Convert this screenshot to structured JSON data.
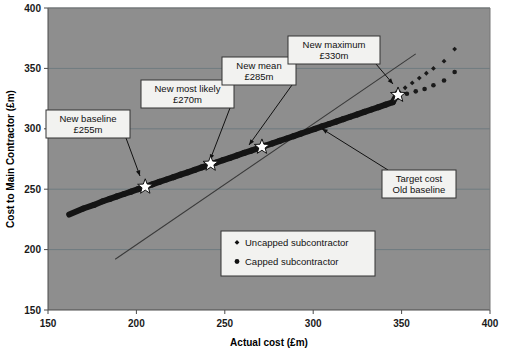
{
  "chart_data": {
    "type": "scatter",
    "title": "",
    "xlabel": "Actual cost (£m)",
    "ylabel": "Cost to Main Contractor (£m)",
    "xlim": [
      150,
      400
    ],
    "ylim": [
      150,
      400
    ],
    "xticks": [
      "150",
      "200",
      "250",
      "300",
      "350",
      "400"
    ],
    "yticks": [
      "150",
      "200",
      "250",
      "300",
      "350",
      "400"
    ],
    "grid": true,
    "legend_position": "inside-lower-center",
    "plot_background": "#8e8e8e",
    "series": [
      {
        "name": "Uncapped subcontractor",
        "marker": "diamond",
        "color": "#1a1a1a",
        "points": [
          [
            162,
            229
          ],
          [
            170,
            234
          ],
          [
            176,
            237
          ],
          [
            181,
            240
          ],
          [
            185,
            242
          ],
          [
            189,
            244
          ],
          [
            193,
            246
          ],
          [
            197,
            248
          ],
          [
            201,
            250
          ],
          [
            205,
            252
          ],
          [
            209,
            254
          ],
          [
            213,
            256
          ],
          [
            217,
            258
          ],
          [
            221,
            260
          ],
          [
            225,
            262
          ],
          [
            229,
            264
          ],
          [
            233,
            266
          ],
          [
            237,
            268
          ],
          [
            241,
            270
          ],
          [
            245,
            272
          ],
          [
            249,
            274
          ],
          [
            253,
            276
          ],
          [
            257,
            278
          ],
          [
            261,
            280
          ],
          [
            265,
            282
          ],
          [
            269,
            284
          ],
          [
            273,
            286
          ],
          [
            277,
            288
          ],
          [
            281,
            290
          ],
          [
            285,
            292
          ],
          [
            289,
            294
          ],
          [
            293,
            296
          ],
          [
            297,
            298
          ],
          [
            301,
            300
          ],
          [
            305,
            302
          ],
          [
            309,
            304
          ],
          [
            313,
            306
          ],
          [
            317,
            308
          ],
          [
            321,
            310
          ],
          [
            325,
            312
          ],
          [
            329,
            314
          ],
          [
            333,
            316
          ],
          [
            337,
            318
          ],
          [
            341,
            320
          ],
          [
            345,
            322
          ],
          [
            348,
            330
          ],
          [
            352,
            334
          ],
          [
            356,
            338
          ],
          [
            360,
            342
          ],
          [
            364,
            346
          ],
          [
            368,
            350
          ],
          [
            374,
            356
          ],
          [
            380,
            366
          ]
        ]
      },
      {
        "name": "Capped subcontractor",
        "marker": "circle",
        "color": "#1a1a1a",
        "points": [
          [
            162,
            229
          ],
          [
            170,
            234
          ],
          [
            176,
            237
          ],
          [
            181,
            240
          ],
          [
            185,
            242
          ],
          [
            189,
            244
          ],
          [
            193,
            246
          ],
          [
            197,
            248
          ],
          [
            201,
            250
          ],
          [
            205,
            252
          ],
          [
            209,
            254
          ],
          [
            213,
            256
          ],
          [
            217,
            258
          ],
          [
            221,
            260
          ],
          [
            225,
            262
          ],
          [
            229,
            264
          ],
          [
            233,
            266
          ],
          [
            237,
            268
          ],
          [
            241,
            270
          ],
          [
            245,
            272
          ],
          [
            249,
            274
          ],
          [
            253,
            276
          ],
          [
            257,
            278
          ],
          [
            261,
            280
          ],
          [
            265,
            282
          ],
          [
            269,
            284
          ],
          [
            273,
            286
          ],
          [
            277,
            288
          ],
          [
            281,
            290
          ],
          [
            285,
            292
          ],
          [
            289,
            294
          ],
          [
            293,
            296
          ],
          [
            297,
            298
          ],
          [
            301,
            300
          ],
          [
            305,
            302
          ],
          [
            309,
            304
          ],
          [
            313,
            306
          ],
          [
            317,
            308
          ],
          [
            321,
            310
          ],
          [
            325,
            312
          ],
          [
            329,
            314
          ],
          [
            333,
            316
          ],
          [
            337,
            318
          ],
          [
            341,
            320
          ],
          [
            345,
            322
          ],
          [
            348,
            326
          ],
          [
            353,
            329
          ],
          [
            358,
            331
          ],
          [
            363,
            333
          ],
          [
            368,
            336
          ],
          [
            374,
            340
          ],
          [
            380,
            347
          ]
        ]
      }
    ],
    "reference_line": {
      "name": "Target cost / Old baseline",
      "from": [
        188,
        192
      ],
      "to": [
        358,
        362
      ],
      "color": "#3a3a3a"
    },
    "markers": [
      {
        "id": "new-baseline",
        "label_line1": "New baseline",
        "label_line2": "£255m",
        "x": 205,
        "y": 252
      },
      {
        "id": "new-most-likely",
        "label_line1": "New most likely",
        "label_line2": "£270m",
        "x": 242,
        "y": 271
      },
      {
        "id": "new-mean",
        "label_line1": "New mean",
        "label_line2": "£285m",
        "x": 271,
        "y": 285
      },
      {
        "id": "new-maximum",
        "label_line1": "New maximum",
        "label_line2": "£330m",
        "x": 348,
        "y": 328
      }
    ],
    "annotations": [
      {
        "id": "target-cost",
        "line1": "Target cost",
        "line2": "Old baseline",
        "target_x": 305,
        "target_y": 300
      }
    ],
    "legend": [
      {
        "label": "Uncapped subcontractor",
        "marker": "diamond"
      },
      {
        "label": "Capped subcontractor",
        "marker": "circle"
      }
    ]
  }
}
